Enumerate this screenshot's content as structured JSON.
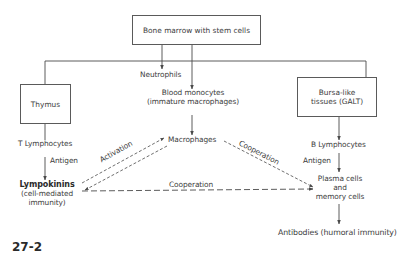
{
  "diagram": {
    "nodes": {
      "bone_marrow": "Bone marrow with stem cells",
      "neutrophils": "Neutrophils",
      "blood_monocytes": [
        "Blood monocytes",
        "(immature macrophages)"
      ],
      "thymus": "Thymus",
      "bursa": [
        "Bursa-like",
        "tissues (GALT)"
      ],
      "t_lymphocytes": "T Lymphocytes",
      "macrophages": "Macrophages",
      "b_lymphocytes": "B Lymphocytes",
      "lympokinins": "Lympokinins",
      "cell_mediated": [
        "(cell-mediated",
        "immunity)"
      ],
      "plasma_cells": [
        "Plasma cells",
        "and",
        "memory cells"
      ],
      "antibodies": "Antibodies (humoral immunity)"
    },
    "edge_labels": {
      "antigen_left": "Antigen",
      "antigen_right": "Antigen",
      "activation": "Activation",
      "cooperation_diag": "Cooperation",
      "cooperation_horiz": "Cooperation"
    },
    "figure_label": "27-2",
    "colors": {
      "line": "#4a4a4a",
      "text": "#3c3c3c",
      "background": "#ffffff"
    }
  }
}
